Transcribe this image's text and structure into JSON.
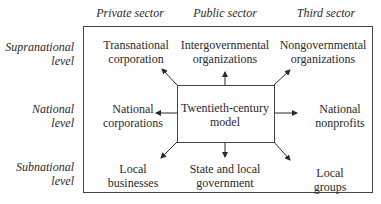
{
  "columns": [
    "Private sector",
    "Public sector",
    "Third sector"
  ],
  "rows": [
    {
      "label_line1": "Supranational",
      "label_line2": "level"
    },
    {
      "label_line1": "National",
      "label_line2": "level"
    },
    {
      "label_line1": "Subnational",
      "label_line2": "level"
    }
  ],
  "center": {
    "line1": "Twentieth-century",
    "line2": "model"
  },
  "cells": {
    "top_left": {
      "line1": "Transnational",
      "line2": "corporation"
    },
    "top_mid": {
      "line1": "Intergovernmental",
      "line2": "organizations"
    },
    "top_right": {
      "line1": "Nongovernmental",
      "line2": "organizations"
    },
    "mid_left": {
      "line1": "National",
      "line2": "corporations"
    },
    "mid_right": {
      "line1": "National",
      "line2": "nonprofits"
    },
    "bot_left": {
      "line1": "Local",
      "line2": "businesses"
    },
    "bot_mid": {
      "line1": "State and local",
      "line2": "government"
    },
    "bot_right": {
      "line1": "Local",
      "line2": "groups"
    }
  }
}
